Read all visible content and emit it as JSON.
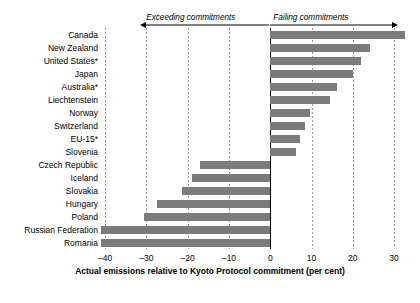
{
  "chart_data": {
    "type": "bar",
    "orientation": "horizontal",
    "title": "",
    "xlabel": "Actual emissions relative to Kyoto Protocol commitment (per cent)",
    "ylabel": "",
    "xlim": [
      -41,
      33.6
    ],
    "xticks": [
      -40,
      -30,
      -20,
      -10,
      0,
      10,
      20,
      30
    ],
    "xticklabels": [
      "–40",
      "–30",
      "–20",
      "–10",
      "0",
      "10",
      "20",
      "30"
    ],
    "grid": "vertical-dashed",
    "legend": "none",
    "bar_color": "#7b7b7b",
    "categories": [
      "Canada",
      "New Zealand",
      "United States*",
      "Japan",
      "Australia*",
      "Liechtenstein",
      "Norway",
      "Switzerland",
      "EU-15*",
      "Slovenia",
      "Czech Republic",
      "Iceland",
      "Slovakia",
      "Hungary",
      "Poland",
      "Russian Federation",
      "Romania"
    ],
    "values": [
      32.6,
      24.2,
      22.0,
      20.1,
      16.2,
      14.5,
      9.7,
      8.5,
      7.3,
      6.3,
      -17.0,
      -19.0,
      -21.5,
      -27.5,
      -30.5,
      -41.0,
      -41.0
    ],
    "annotations": [
      {
        "text": "Exceeding commitments",
        "direction": "left",
        "from": 0,
        "to": -31.5
      },
      {
        "text": "Failing commitments",
        "direction": "right",
        "from": 0,
        "to": 31.0
      }
    ]
  }
}
